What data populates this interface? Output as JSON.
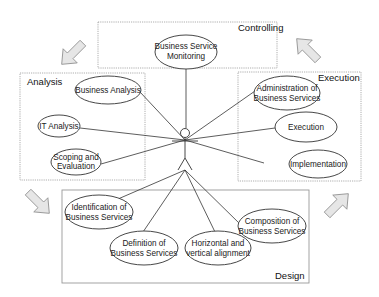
{
  "diagram": {
    "type": "use-case",
    "actor": {
      "label": ""
    },
    "phases": [
      {
        "id": "controlling",
        "title": "Controlling",
        "use_cases": [
          {
            "label_lines": [
              "Business Service",
              "Monitoring"
            ]
          }
        ]
      },
      {
        "id": "analysis",
        "title": "Analysis",
        "use_cases": [
          {
            "label_lines": [
              "Business Analysis"
            ]
          },
          {
            "label_lines": [
              "IT Analysis"
            ]
          },
          {
            "label_lines": [
              "Scoping and",
              "Evaluation"
            ]
          }
        ]
      },
      {
        "id": "execution",
        "title": "Execution",
        "use_cases": [
          {
            "label_lines": [
              "Administration of",
              "Business Services"
            ]
          },
          {
            "label_lines": [
              "Execution"
            ]
          },
          {
            "label_lines": [
              "Implementation"
            ]
          }
        ]
      },
      {
        "id": "design",
        "title": "Design",
        "use_cases": [
          {
            "label_lines": [
              "Identification of",
              "Business Services"
            ]
          },
          {
            "label_lines": [
              "Definition of",
              "Business Services"
            ]
          },
          {
            "label_lines": [
              "Horizontal and",
              "vertical alignment"
            ]
          },
          {
            "label_lines": [
              "Composition of",
              "Business Services"
            ]
          }
        ]
      }
    ],
    "cycle_arrows": [
      {
        "from": "controlling",
        "to": "analysis",
        "direction": "down-left"
      },
      {
        "from": "analysis",
        "to": "design",
        "direction": "down-right"
      },
      {
        "from": "design",
        "to": "execution",
        "direction": "up-right"
      },
      {
        "from": "execution",
        "to": "controlling",
        "direction": "up-left"
      }
    ],
    "colors": {
      "line": "#333333",
      "box_border": "#888888",
      "arrow_fill": "#e6e6e6",
      "arrow_stroke": "#888888"
    }
  }
}
